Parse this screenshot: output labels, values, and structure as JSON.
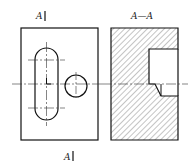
{
  "drawing": {
    "type": "engineering section drawing",
    "labels": {
      "top_section_marker": "A",
      "bottom_section_marker": "A",
      "section_title": "A—A"
    },
    "views": [
      {
        "name": "front-view",
        "features": [
          "outer rectangle",
          "oblong slot",
          "round hole",
          "centerlines"
        ]
      },
      {
        "name": "section-view-A-A",
        "features": [
          "hatched section",
          "rectangular cutout",
          "chamfered step",
          "centerline"
        ]
      }
    ],
    "colors": {
      "line": "#111111",
      "hatch": "#444444",
      "background": "#ffffff"
    }
  }
}
